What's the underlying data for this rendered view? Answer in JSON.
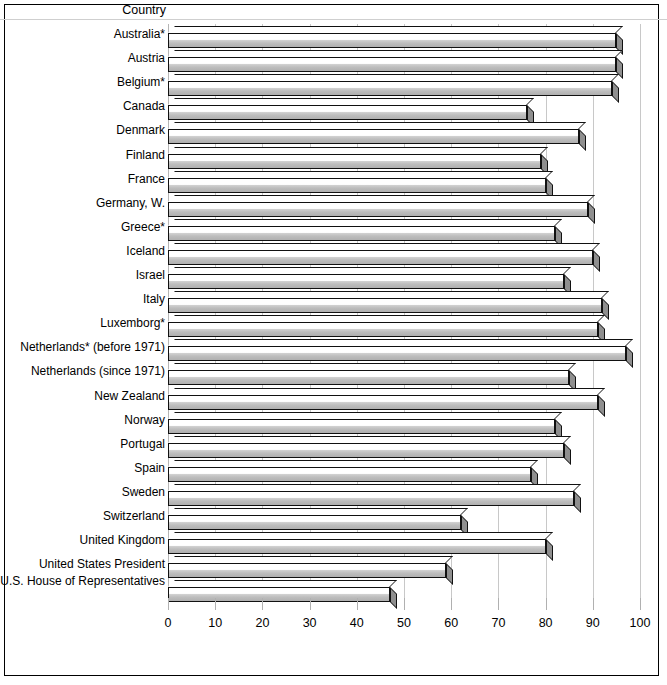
{
  "header": {
    "country_label": "Country"
  },
  "chart_data": {
    "type": "bar",
    "orientation": "horizontal",
    "title": "",
    "xlabel": "",
    "ylabel": "Country",
    "xlim": [
      0,
      100
    ],
    "xticks": [
      0,
      10,
      20,
      30,
      40,
      50,
      60,
      70,
      80,
      90,
      100
    ],
    "grid": true,
    "legend": "none",
    "categories": [
      "Australia*",
      "Austria",
      "Belgium*",
      "Canada",
      "Denmark",
      "Finland",
      "France",
      "Germany, W.",
      "Greece*",
      "Iceland",
      "Israel",
      "Italy",
      "Luxemborg*",
      "Netherlands* (before 1971)",
      "Netherlands (since 1971)",
      "New Zealand",
      "Norway",
      "Portugal",
      "Spain",
      "Sweden",
      "Switzerland",
      "United Kingdom",
      "United States President",
      "U.S. House of Representatives"
    ],
    "values": [
      95,
      95,
      94,
      76,
      87,
      79,
      80,
      89,
      82,
      90,
      84,
      92,
      91,
      97,
      85,
      91,
      82,
      84,
      77,
      86,
      62,
      80,
      59,
      47
    ]
  }
}
